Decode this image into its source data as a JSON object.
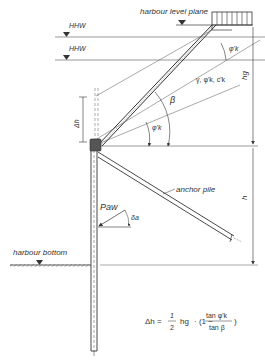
{
  "labels": {
    "harbour_level_plane": "harbour level plane",
    "hhw_upper": "HHW",
    "hhw_lower": "HHW",
    "soil_params": "γ, φ'k, c'k",
    "beta": "β",
    "phi_k_slope": "φ'k",
    "phi_k_top": "φ'k",
    "delta_h": "Δh",
    "h_g": "hg",
    "h": "h",
    "anchor_pile": "anchor pile",
    "p_aw": "Paw",
    "delta_a": "δa",
    "harbour_bottom": "harbour bottom"
  },
  "formula": {
    "lhs": "Δh =",
    "frac_num": "1",
    "frac_den": "2",
    "hg": "hg",
    "mid": "· (1 −",
    "tan_num": "tan φ'k",
    "tan_den": "tan β",
    "close": ")"
  },
  "colors": {
    "line": "#333333",
    "fill_dark": "#555555",
    "hatch": "#888888"
  }
}
